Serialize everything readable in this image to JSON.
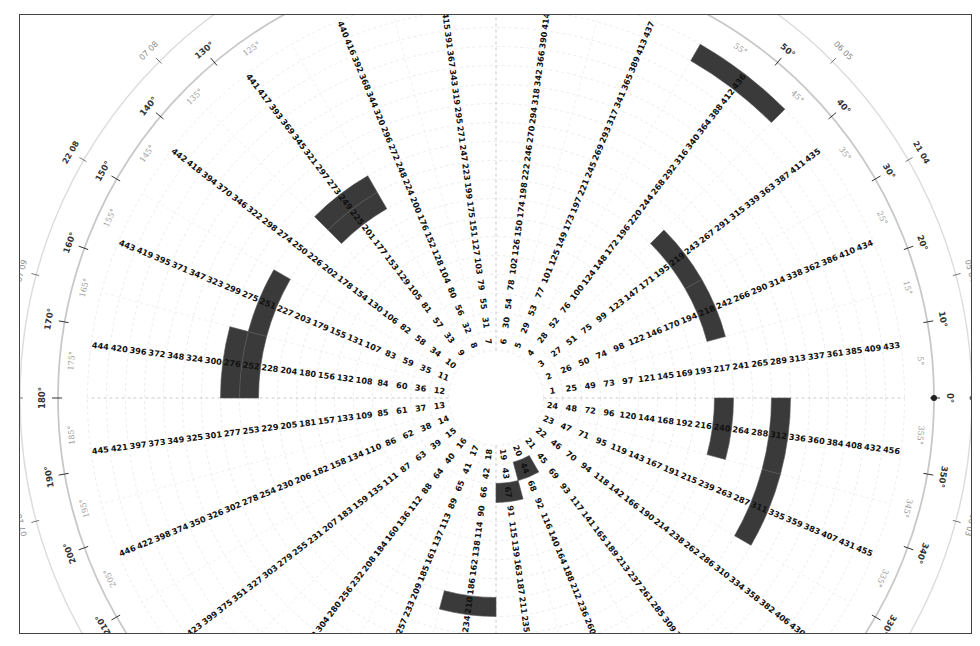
{
  "chart_data": {
    "type": "polar-heatmap",
    "title": "",
    "center_px": [
      495,
      397
    ],
    "spokes": 24,
    "rings": 19,
    "spoke_angle_rule": "spoke k (1..24) at (k-1)*15 + 7.5 degrees, counter-clockwise from 0 deg (east)",
    "cell_number_rule": "n = (ring-1)*24 + spoke",
    "cell_range": [
      1,
      456
    ],
    "highlighted_cells": [
      44,
      67,
      210,
      218,
      219,
      225,
      240,
      249,
      251,
      252,
      276,
      311,
      312,
      436
    ],
    "highlight_color": "#3a3a3a",
    "angle_ticks_major": [
      "0°",
      "10°",
      "20°",
      "30°",
      "40°",
      "50°",
      "130°",
      "140°",
      "150°",
      "160°",
      "170°",
      "180°",
      "190°",
      "200°",
      "210°",
      "330°",
      "340°",
      "350°"
    ],
    "angle_ticks_minor": [
      "5°",
      "15°",
      "25°",
      "35°",
      "45°",
      "55°",
      "125°",
      "135°",
      "145°",
      "155°",
      "165°",
      "175°",
      "185°",
      "195°",
      "205°",
      "335°",
      "345°",
      "355°"
    ],
    "outer_time_labels": [
      {
        "angle": 0,
        "text": "21 03"
      },
      {
        "angle": 15,
        "text": "05 04"
      },
      {
        "angle": 30,
        "text": "21 04"
      },
      {
        "angle": 45,
        "text": "06 05"
      },
      {
        "angle": 135,
        "text": "07 08"
      },
      {
        "angle": 150,
        "text": "22 08"
      },
      {
        "angle": 165,
        "text": "07 09"
      },
      {
        "angle": 180,
        "text": "22 09"
      },
      {
        "angle": 195,
        "text": "07 10"
      },
      {
        "angle": 345,
        "text": "06 03"
      }
    ],
    "grid": true,
    "legend": null
  }
}
